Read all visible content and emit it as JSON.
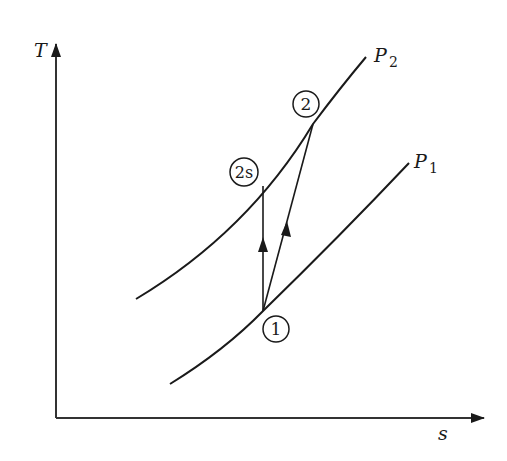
{
  "diagram": {
    "type": "T-s diagram (compression process)",
    "axes": {
      "y_label": "T",
      "x_label": "s"
    },
    "isobars": [
      {
        "id": "P2",
        "label": "P",
        "subscript": "2"
      },
      {
        "id": "P1",
        "label": "P",
        "subscript": "1"
      }
    ],
    "states": [
      {
        "id": "1",
        "label": "1"
      },
      {
        "id": "2",
        "label": "2"
      },
      {
        "id": "2s",
        "label": "2s"
      }
    ],
    "processes": [
      {
        "from": "1",
        "to": "2s",
        "kind": "isentropic (vertical)"
      },
      {
        "from": "1",
        "to": "2",
        "kind": "actual"
      }
    ],
    "colors": {
      "line": "#1a1a1a",
      "background": "#ffffff"
    }
  }
}
